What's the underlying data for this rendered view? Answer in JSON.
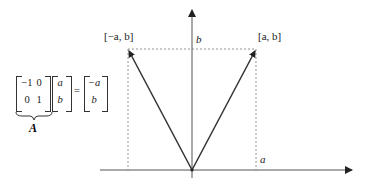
{
  "diagram": {
    "labels": {
      "left_point": "[−a, b]",
      "right_point": "[a, b]",
      "y_tick": "b",
      "x_tick": "a"
    },
    "equation": {
      "matrix_A": [
        [
          "−1",
          "0"
        ],
        [
          "0",
          "1"
        ]
      ],
      "vector": [
        "a",
        "b"
      ],
      "equals": "=",
      "result": [
        "−a",
        "b"
      ],
      "matrix_name": "A"
    },
    "geometry": {
      "origin": [
        192,
        170
      ],
      "right_point": [
        256,
        50
      ],
      "left_point": [
        128,
        50
      ],
      "x_axis_end": 352,
      "y_axis_top": 10
    },
    "colors": {
      "axis": "#555555",
      "vector": "#333333",
      "guide": "#888888"
    }
  }
}
